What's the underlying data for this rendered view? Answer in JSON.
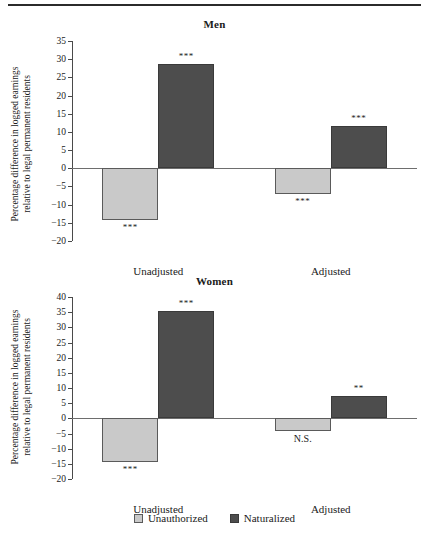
{
  "figure": {
    "ylabel_line1": "Percentage difference in logged earnings",
    "ylabel_line2": "relative to legal permanent residents"
  },
  "legend": {
    "items": [
      {
        "label": "Unauthorized",
        "color": "#c9c9c9",
        "swatch": "light"
      },
      {
        "label": "Naturalized",
        "color": "#4d4d4d",
        "swatch": "dark"
      }
    ]
  },
  "chart_data": [
    {
      "type": "bar",
      "title": "Men",
      "xlabel": "",
      "ylabel": "Percentage difference in logged earnings relative to legal permanent residents",
      "categories": [
        "Unadjusted",
        "Adjusted"
      ],
      "ylim": [
        -20,
        35
      ],
      "yticks": [
        35,
        30,
        25,
        20,
        15,
        10,
        5,
        0,
        -5,
        -10,
        -15,
        -20
      ],
      "ytick_labels": [
        "35",
        "30",
        "25",
        "20",
        "15",
        "10",
        "5",
        "0",
        "−5",
        "−10",
        "−15",
        "−20"
      ],
      "grid": false,
      "legend_position": "bottom",
      "series": [
        {
          "name": "Unauthorized",
          "color": "#c9c9c9",
          "values": [
            -14.3,
            -7.1
          ],
          "annotations": [
            "***",
            "***"
          ]
        },
        {
          "name": "Naturalized",
          "color": "#4d4d4d",
          "values": [
            28.7,
            11.5
          ],
          "annotations": [
            "***",
            "***"
          ]
        }
      ]
    },
    {
      "type": "bar",
      "title": "Women",
      "xlabel": "",
      "ylabel": "Percentage difference in logged earnings relative to legal permanent residents",
      "categories": [
        "Unadjusted",
        "Adjusted"
      ],
      "ylim": [
        -20,
        40
      ],
      "yticks": [
        40,
        35,
        30,
        25,
        20,
        15,
        10,
        5,
        0,
        -5,
        -10,
        -15,
        -20
      ],
      "ytick_labels": [
        "40",
        "35",
        "30",
        "25",
        "20",
        "15",
        "10",
        "5",
        "0",
        "−5",
        "−10",
        "−15",
        "−20"
      ],
      "grid": false,
      "legend_position": "bottom",
      "series": [
        {
          "name": "Unauthorized",
          "color": "#c9c9c9",
          "values": [
            -14.3,
            -4.1
          ],
          "annotations": [
            "***",
            "N.S."
          ]
        },
        {
          "name": "Naturalized",
          "color": "#4d4d4d",
          "values": [
            35.5,
            7.2
          ],
          "annotations": [
            "***",
            "**"
          ]
        }
      ]
    }
  ]
}
